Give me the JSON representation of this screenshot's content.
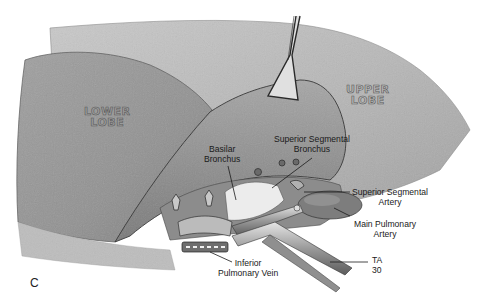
{
  "figure": {
    "panel_letter": "C",
    "colors": {
      "background": "#ffffff",
      "lung_tissue": "#a8a8a8",
      "lung_dark": "#7a7a7a",
      "lung_light": "#cfcfcf",
      "label_text": "#1a1a1a",
      "leader_line": "#222222"
    }
  },
  "lobe_labels": {
    "lower": {
      "line1": "LOWER",
      "line2": "LOBE"
    },
    "upper": {
      "line1": "UPPER",
      "line2": "LOBE"
    }
  },
  "labels": {
    "basilar_bronchus": {
      "line1": "Basilar",
      "line2": "Bronchus"
    },
    "superior_segmental_bronchus": {
      "line1": "Superior Segmental",
      "line2": "Bronchus"
    },
    "superior_segmental_artery": {
      "line1": "Superior Segmental",
      "line2": "Artery"
    },
    "main_pulmonary_artery": {
      "line1": "Main Pulmonary",
      "line2": "Artery"
    },
    "ta30": {
      "line1": "TA",
      "line2": "30"
    },
    "inferior_pulmonary_vein": {
      "line1": "Inferior",
      "line2": "Pulmonary Vein"
    }
  }
}
